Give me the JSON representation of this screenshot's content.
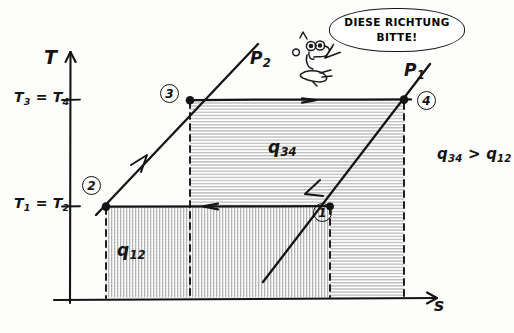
{
  "diagram": {
    "kind": "hand-drawn temperature-entropy (T-s) diagram of a gas power cycle",
    "axes": {
      "y_label": "T",
      "x_label": "s",
      "y_ticks": [
        {
          "id": "tick-upper",
          "label_main": "T",
          "label_sub1": "3",
          "eq": "=",
          "label_main2": "T",
          "label_sub2": "4",
          "text": "T3 = T4"
        },
        {
          "id": "tick-lower",
          "label_main": "T",
          "label_sub1": "1",
          "eq": "=",
          "label_main2": "T",
          "label_sub2": "2",
          "text": "T1 = T2"
        }
      ]
    },
    "state_points": [
      {
        "id": "point-1",
        "number": "1"
      },
      {
        "id": "point-2",
        "number": "2"
      },
      {
        "id": "point-3",
        "number": "3"
      },
      {
        "id": "point-4",
        "number": "4"
      }
    ],
    "isobars": [
      {
        "id": "isobar-p1",
        "label": "P",
        "sub": "1",
        "text": "P1"
      },
      {
        "id": "isobar-p2",
        "label": "P",
        "sub": "2",
        "text": "P2"
      }
    ],
    "heat_areas": [
      {
        "id": "area-q12",
        "label": "q",
        "sub": "12",
        "text": "q12",
        "hatch": "vertical"
      },
      {
        "id": "area-q34",
        "label": "q",
        "sub": "34",
        "text": "q34",
        "hatch": "horizontal"
      }
    ],
    "annotation": {
      "id": "inequality",
      "left": "q",
      "left_sub": "34",
      "operator": ">",
      "right": "q",
      "right_sub": "12",
      "text": "q34 > q12"
    },
    "speech_bubble": {
      "line1": "DIESE RICHTUNG",
      "line2": "BITTE!"
    },
    "colors": {
      "ink": "#141414",
      "paper": "#fdfdfc",
      "hatch": "#9a9a9a"
    }
  }
}
